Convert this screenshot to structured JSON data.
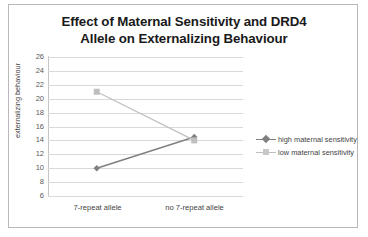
{
  "chart_data": {
    "type": "line",
    "title": "Effect of Maternal Sensitivity and DRD4 Allele on Externalizing Behaviour",
    "title_lines": [
      "Effect of Maternal Sensitivity and DRD4",
      "Allele on Externalizing Behaviour"
    ],
    "categories": [
      "7-repeat allele",
      "no 7-repeat allele"
    ],
    "series": [
      {
        "name": "high maternal sensitivity",
        "values": [
          10,
          14.5
        ],
        "color": "#808080",
        "marker": "diamond"
      },
      {
        "name": "low maternal sensitivity",
        "values": [
          21,
          14
        ],
        "color": "#bfbfbf",
        "marker": "square"
      }
    ],
    "xlabel": "",
    "ylabel": "externalizing behaviour",
    "ylim": [
      6,
      26
    ],
    "ytick_step": 2,
    "yticks": [
      26,
      24,
      22,
      20,
      18,
      16,
      14,
      12,
      10,
      8,
      6
    ],
    "grid": true,
    "legend_position": "right",
    "colors": {
      "gridline": "#d9d9d9",
      "axis": "#c4c4c4",
      "tick_text": "#595959",
      "label_text": "#3f3f3f",
      "title_text": "#1a1a1a",
      "frame": "#b9b9b9",
      "background": "#ffffff"
    }
  }
}
